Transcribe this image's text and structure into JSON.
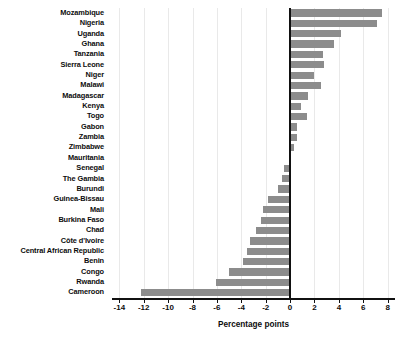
{
  "chart_data": {
    "type": "bar",
    "orientation": "horizontal",
    "title": "",
    "xlabel": "Percentage points",
    "ylabel": "",
    "xlim": [
      -14.6,
      8.6
    ],
    "ylim": [],
    "grid": true,
    "legend": null,
    "bar_color": "#8c8c8c",
    "zero_line_color": "#111111",
    "xticks": [
      -14,
      -12,
      -10,
      -8,
      -6,
      -4,
      -2,
      0,
      2,
      4,
      6,
      8
    ],
    "xticklabels": [
      "-14",
      "-12",
      "-10",
      "-8",
      "-6",
      "-4",
      "-2",
      "0",
      "2",
      "4",
      "6",
      "8"
    ],
    "categories": [
      "Mozambique",
      "Nigeria",
      "Uganda",
      "Ghana",
      "Tanzania",
      "Sierra Leone",
      "Niger",
      "Malawi",
      "Madagascar",
      "Kenya",
      "Togo",
      "Gabon",
      "Zambia",
      "Zimbabwe",
      "Mauritania",
      "Senegal",
      "The Gambia",
      "Burundi",
      "Guinea-Bissau",
      "Mali",
      "Burkina Faso",
      "Chad",
      "Côte d'Ivoire",
      "Central African Republic",
      "Benin",
      "Congo",
      "Rwanda",
      "Cameroon"
    ],
    "values": [
      7.5,
      7.1,
      4.2,
      3.6,
      2.7,
      2.8,
      2.0,
      2.5,
      1.5,
      0.9,
      1.4,
      0.6,
      0.6,
      0.3,
      0.0,
      -0.5,
      -0.7,
      -1.0,
      -1.8,
      -2.2,
      -2.4,
      -2.8,
      -3.3,
      -3.5,
      -3.9,
      -5.0,
      -6.1,
      -12.2
    ]
  }
}
